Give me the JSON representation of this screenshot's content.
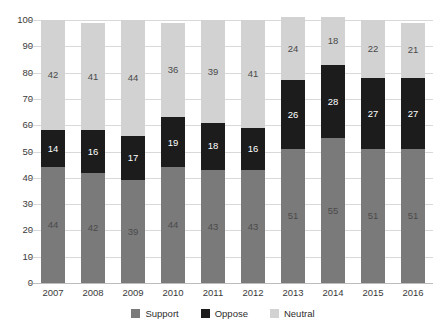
{
  "chart_data": {
    "type": "bar",
    "subtype": "stacked-bar-100-percent",
    "title": "",
    "subtitle": "",
    "xlabel": "",
    "ylabel": "",
    "ylim": [
      0,
      100
    ],
    "yticks": [
      0,
      10,
      20,
      30,
      40,
      50,
      60,
      70,
      80,
      90,
      100
    ],
    "ytick_labels": [
      "0",
      "10",
      "20",
      "30",
      "40",
      "50",
      "60",
      "70",
      "80",
      "90",
      "100"
    ],
    "grid": true,
    "legend_position": "bottom",
    "categories": [
      "2007",
      "2008",
      "2009",
      "2010",
      "2011",
      "2012",
      "2013",
      "2014",
      "2015",
      "2016"
    ],
    "series": [
      {
        "name": "Support",
        "color": "#7a7a7a",
        "values": [
          44,
          42,
          39,
          44,
          43,
          43,
          51,
          55,
          51,
          51
        ]
      },
      {
        "name": "Oppose",
        "color": "#1c1c1c",
        "values": [
          14,
          16,
          17,
          19,
          18,
          16,
          26,
          28,
          27,
          27
        ]
      },
      {
        "name": "Neutral",
        "color": "#d2d2d2",
        "values": [
          42,
          41,
          44,
          36,
          39,
          41,
          24,
          18,
          22,
          21
        ]
      }
    ]
  },
  "legend": {
    "items": [
      {
        "label": "Support",
        "color": "#7a7a7a"
      },
      {
        "label": "Oppose",
        "color": "#1c1c1c"
      },
      {
        "label": "Neutral",
        "color": "#d2d2d2"
      }
    ]
  }
}
